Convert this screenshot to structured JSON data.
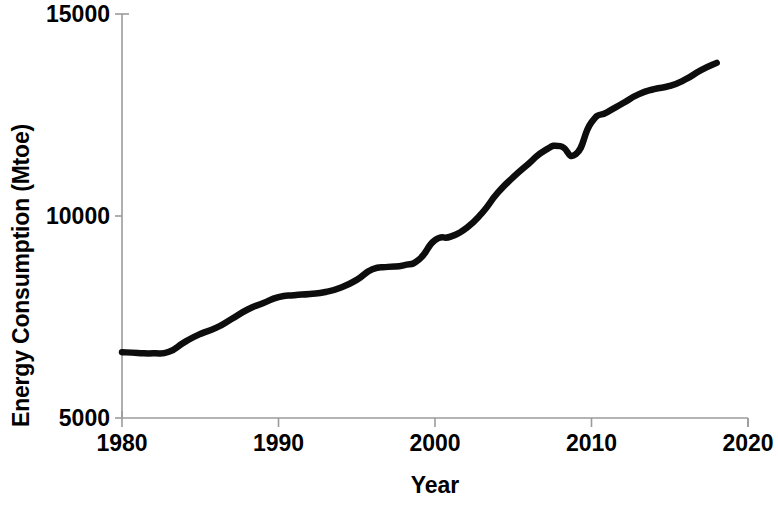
{
  "chart_data": {
    "type": "line",
    "title": "",
    "subtitle": "",
    "xlabel": "Year",
    "ylabel": "Energy Consumption (Mtoe)",
    "xlim": [
      1980,
      2020
    ],
    "ylim": [
      5000,
      15000
    ],
    "xticks": [
      1980,
      1990,
      2000,
      2010,
      2020
    ],
    "xtick_labels": [
      "1980",
      "1990",
      "2000",
      "2010",
      "2020"
    ],
    "yticks": [
      5000,
      10000,
      15000
    ],
    "ytick_labels": [
      "5000",
      "10000",
      "15000"
    ],
    "grid": false,
    "legend": false,
    "legend_position": "none",
    "line_color": "#0d0d0d",
    "line_width_px": 6.5,
    "axis_color": "#9b9b9b",
    "background_color": "#ffffff",
    "series": [
      {
        "name": "World primary energy consumption",
        "x": [
          1980,
          1981,
          1982,
          1983,
          1984,
          1985,
          1986,
          1987,
          1988,
          1989,
          1990,
          1991,
          1992,
          1993,
          1994,
          1995,
          1996,
          1997,
          1998,
          1999,
          2000,
          2001,
          2002,
          2003,
          2004,
          2005,
          2006,
          2007,
          2008,
          2009,
          2010,
          2011,
          2012,
          2013,
          2014,
          2015,
          2016,
          2017,
          2018
        ],
        "values": [
          6630,
          6610,
          6600,
          6640,
          6880,
          7080,
          7230,
          7450,
          7680,
          7840,
          7990,
          8040,
          8070,
          8120,
          8230,
          8420,
          8680,
          8740,
          8780,
          8930,
          9400,
          9490,
          9700,
          10070,
          10570,
          10960,
          11300,
          11620,
          11730,
          11530,
          12320,
          12570,
          12790,
          13010,
          13140,
          13220,
          13380,
          13610,
          13790
        ]
      }
    ]
  },
  "axes": {
    "y_title": "Energy Consumption (Mtoe)",
    "x_title": "Year"
  }
}
